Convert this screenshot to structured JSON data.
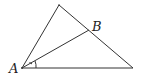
{
  "diagram": {
    "type": "triangle-with-angle-bisector",
    "labels": {
      "A": "A",
      "B": "B"
    },
    "points": {
      "A": [
        22,
        68
      ],
      "apex": [
        59,
        5
      ],
      "right": [
        133,
        68
      ],
      "B": [
        89,
        30
      ]
    },
    "stroke_color": "#333333"
  }
}
